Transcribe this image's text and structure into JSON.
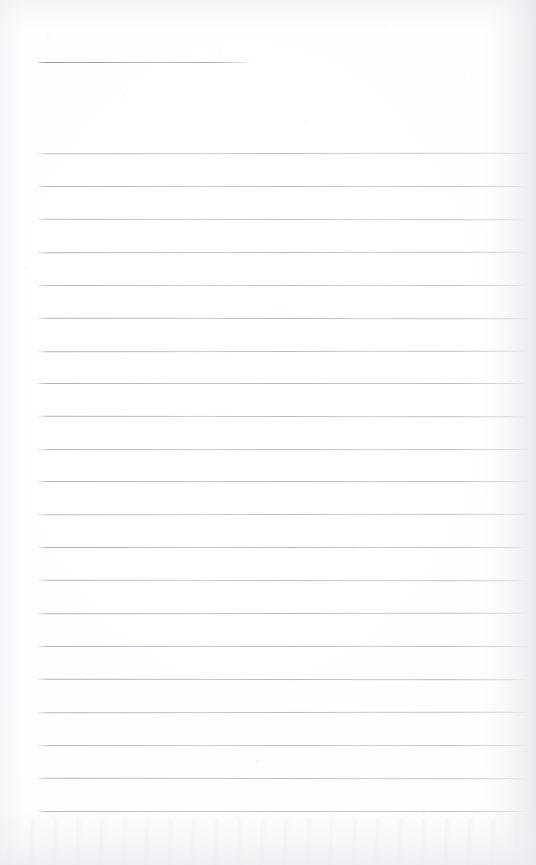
{
  "document": {
    "kind": "scanned-ruled-notepad-page",
    "title": "",
    "page_width": 536,
    "page_height": 865,
    "paper_color": "#fdfdfd",
    "is_blank": true,
    "written_content": [],
    "visible_text": []
  },
  "header_rule": {
    "name": "title-rule",
    "x": 37,
    "y": 62,
    "width": 215,
    "color": "#9ca1aa"
  },
  "ruling": {
    "line_color": "#aeb2ba",
    "line_start_x": 37,
    "line_end_x": 528,
    "line_thickness": 1,
    "line_spacing": 32.7,
    "first_line_y": 153,
    "line_count": 21,
    "lines_y": [
      153,
      186,
      219,
      252,
      285,
      318,
      351,
      383,
      416,
      449,
      481,
      514,
      547,
      580,
      613,
      646,
      679,
      712,
      745,
      778,
      811
    ]
  },
  "shading": {
    "right_edge": "#e4e6ea",
    "bottom_edge": "#eaecef",
    "top_edge": "#eef0f2",
    "vignette": "#f3f4f5"
  }
}
